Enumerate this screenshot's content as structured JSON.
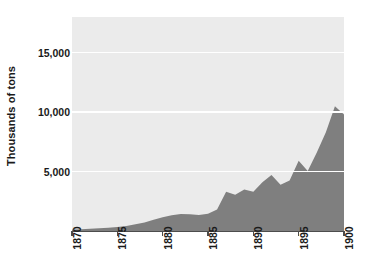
{
  "chart_data": {
    "type": "area",
    "title": "",
    "xlabel": "",
    "ylabel": "Thousands of tons",
    "xlim": [
      1870,
      1900
    ],
    "ylim": [
      0,
      18000
    ],
    "grid": true,
    "legend": "none",
    "series_color": "#7f7f7f",
    "panel_color": "#ebebeb",
    "gridline_color": "#ffffff",
    "axis_color": "#4d4d4d",
    "y_ticks": [
      {
        "value": 5000,
        "label": "5,000"
      },
      {
        "value": 10000,
        "label": "10,000"
      },
      {
        "value": 15000,
        "label": "15,000"
      }
    ],
    "x_ticks": [
      {
        "value": 1870,
        "label": "1870"
      },
      {
        "value": 1875,
        "label": "1875"
      },
      {
        "value": 1880,
        "label": "1880"
      },
      {
        "value": 1885,
        "label": "1885"
      },
      {
        "value": 1890,
        "label": "1890"
      },
      {
        "value": 1895,
        "label": "1895"
      },
      {
        "value": 1900,
        "label": "1900"
      }
    ],
    "x": [
      1870,
      1871,
      1872,
      1873,
      1874,
      1875,
      1876,
      1877,
      1878,
      1879,
      1880,
      1881,
      1882,
      1883,
      1884,
      1885,
      1886,
      1887,
      1888,
      1889,
      1890,
      1891,
      1892,
      1893,
      1894,
      1895,
      1896,
      1897,
      1898,
      1899,
      1900
    ],
    "values": [
      120,
      150,
      190,
      230,
      270,
      330,
      420,
      560,
      720,
      950,
      1150,
      1330,
      1420,
      1400,
      1350,
      1450,
      1800,
      3300,
      3050,
      3500,
      3300,
      4100,
      4700,
      3900,
      4250,
      5900,
      5050,
      6600,
      8300,
      10500,
      9800
    ],
    "annotations": []
  }
}
